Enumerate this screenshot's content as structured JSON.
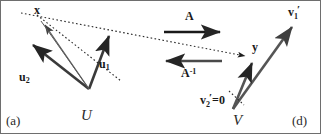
{
  "figure": {
    "type": "vector-space-linear-map-diagram",
    "background_color": "#ffffff",
    "ink_color": "#404040",
    "border_color": "#6e6e6e"
  },
  "left_panel": {
    "caption": "(a)",
    "space_label": "U",
    "vector_x": "x",
    "basis_1": "u",
    "basis_1_sub": "1",
    "basis_2": "u",
    "basis_2_sub": "2"
  },
  "right_panel": {
    "caption": "(d)",
    "space_label": "V",
    "vector_y": "y",
    "basis_1": "v",
    "basis_1_sub": "1",
    "basis_2": "v",
    "basis_2_sub": "2",
    "basis_2_value": "=0"
  },
  "mapping": {
    "forward_label": "A",
    "inverse_label": "A",
    "inverse_exponent": "-1"
  }
}
